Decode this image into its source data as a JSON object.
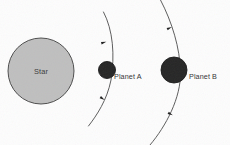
{
  "diagram": {
    "background_color": "#fdfdfd",
    "bodies": [
      {
        "id": "star",
        "label": "Star",
        "kind": "star",
        "fill_color": "#bfbfbf",
        "stroke_color": "#3d3d3d",
        "cx": 41,
        "cy": 71,
        "r": 33,
        "label_x": 41,
        "label_y": 73.5,
        "label_anchor": "middle",
        "label_class": "star-label"
      },
      {
        "id": "planet-a",
        "label": "Planet A",
        "kind": "planet",
        "fill_color": "#262626",
        "stroke_color": "#1a1a1a",
        "cx": 107,
        "cy": 70,
        "r": 8.5,
        "label_x": 114,
        "label_y": 79,
        "label_anchor": "start",
        "label_class": "body-label"
      },
      {
        "id": "planet-b",
        "label": "Planet B",
        "kind": "planet",
        "fill_color": "#262626",
        "stroke_color": "#1a1a1a",
        "cx": 174,
        "cy": 70,
        "r": 13,
        "label_x": 189,
        "label_y": 79,
        "label_anchor": "start",
        "label_class": "body-label"
      }
    ],
    "orbits": [
      {
        "id": "orbit-a",
        "belongs_to": "Planet A",
        "stroke_color": "#4a4a4a",
        "stroke_width": 0.9,
        "path": "M 103.5 12 C 113 30 115 55 111 80 C 107 100 97 115 88.5 126",
        "arrow_markers": [
          {
            "x": 103.8,
            "y": 42.5,
            "angle": 74,
            "direction": "clockwise"
          },
          {
            "x": 102.5,
            "y": 98.5,
            "angle": 123,
            "direction": "clockwise"
          }
        ]
      },
      {
        "id": "orbit-b",
        "belongs_to": "Planet B",
        "stroke_color": "#4a4a4a",
        "stroke_width": 0.9,
        "path": "M 160.5 0 C 172 22 180 48 180.5 72 C 181 98 166 126 150 145",
        "arrow_markers": [
          {
            "x": 169.5,
            "y": 28,
            "angle": 65,
            "direction": "clockwise"
          },
          {
            "x": 170.5,
            "y": 114,
            "angle": 118,
            "direction": "clockwise"
          }
        ]
      }
    ],
    "arrow_style": {
      "fill_color": "#1f1f1f",
      "length": 5.2,
      "width": 2.6
    }
  }
}
